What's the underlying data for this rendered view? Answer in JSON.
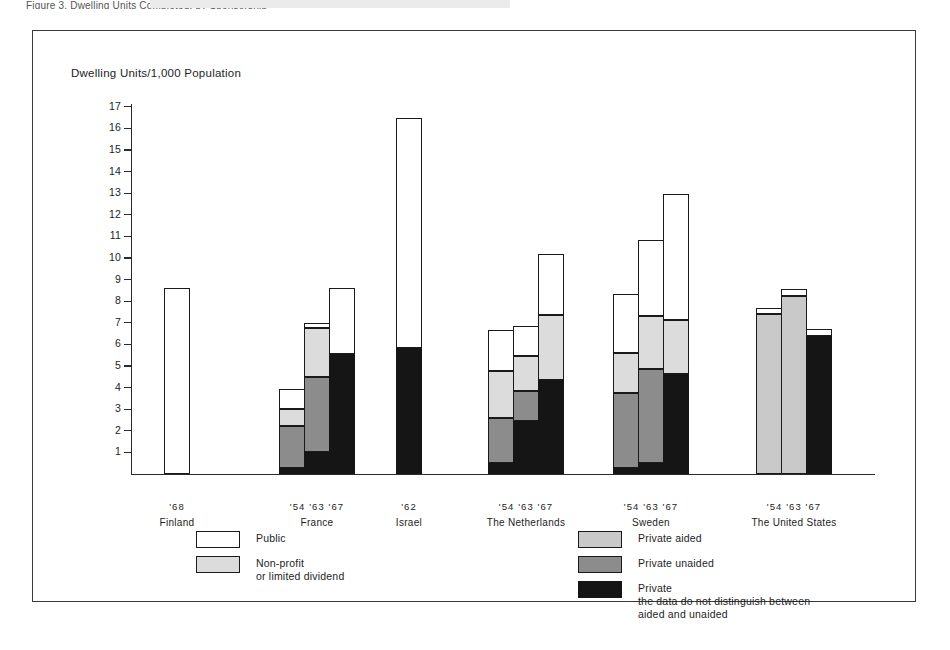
{
  "page": {
    "cropped_caption": "Figure 3. Dwelling Units Completed, by Sponsorship"
  },
  "chart_data": {
    "type": "bar",
    "subtype": "stacked",
    "title": "Dwelling Units/1,000 Population",
    "ylabel": "Dwelling Units/1,000 Population",
    "xlabel": "",
    "ylim": [
      0,
      17
    ],
    "yticks": [
      1,
      2,
      3,
      4,
      5,
      6,
      7,
      8,
      9,
      10,
      11,
      12,
      13,
      14,
      15,
      16,
      17
    ],
    "grid": false,
    "legend_position": "bottom",
    "series": [
      {
        "key": "public",
        "name": "Public",
        "color": "#ffffff"
      },
      {
        "key": "nonprofit",
        "name": "Non-profit or limited dividend",
        "color": "#dcdcdc"
      },
      {
        "key": "aided",
        "name": "Private aided",
        "color": "#c9c9c9"
      },
      {
        "key": "unaided",
        "name": "Private unaided",
        "color": "#8c8c8c"
      },
      {
        "key": "private",
        "name": "Private (aided and unaided combined)",
        "color": "#151515"
      }
    ],
    "groups": [
      {
        "country": "Finland",
        "years": "'68",
        "bars": [
          {
            "year": "'68",
            "total": 8.6,
            "segments": [
              {
                "key": "public",
                "value": 8.6
              }
            ]
          }
        ]
      },
      {
        "country": "France",
        "years": "'54 '63 '67",
        "bars": [
          {
            "year": "'54",
            "total": 3.95,
            "segments": [
              {
                "key": "public",
                "value": 0.95
              },
              {
                "key": "nonprofit",
                "value": 0.8
              },
              {
                "key": "unaided",
                "value": 1.9
              },
              {
                "key": "private",
                "value": 0.3
              }
            ]
          },
          {
            "year": "'63",
            "total": 7.0,
            "segments": [
              {
                "key": "public",
                "value": 0.25
              },
              {
                "key": "nonprofit",
                "value": 2.25
              },
              {
                "key": "unaided",
                "value": 3.5
              },
              {
                "key": "private",
                "value": 1.0
              }
            ]
          },
          {
            "year": "'67",
            "total": 8.6,
            "segments": [
              {
                "key": "public",
                "value": 3.05
              },
              {
                "key": "private",
                "value": 5.55
              }
            ]
          }
        ]
      },
      {
        "country": "Israel",
        "years": "'62",
        "bars": [
          {
            "year": "'62",
            "total": 16.5,
            "segments": [
              {
                "key": "public",
                "value": 10.65
              },
              {
                "key": "private",
                "value": 5.85
              }
            ]
          }
        ]
      },
      {
        "country": "The Netherlands",
        "years": "'54 '63 '67",
        "bars": [
          {
            "year": "'54",
            "total": 6.65,
            "segments": [
              {
                "key": "public",
                "value": 1.9
              },
              {
                "key": "nonprofit",
                "value": 2.15
              },
              {
                "key": "unaided",
                "value": 2.1
              },
              {
                "key": "private",
                "value": 0.5
              }
            ]
          },
          {
            "year": "'63",
            "total": 6.85,
            "segments": [
              {
                "key": "public",
                "value": 1.4
              },
              {
                "key": "nonprofit",
                "value": 1.6
              },
              {
                "key": "unaided",
                "value": 1.4
              },
              {
                "key": "private",
                "value": 2.45
              }
            ]
          },
          {
            "year": "'67",
            "total": 10.2,
            "segments": [
              {
                "key": "public",
                "value": 2.85
              },
              {
                "key": "nonprofit",
                "value": 3.0
              },
              {
                "key": "private",
                "value": 4.35
              }
            ]
          }
        ]
      },
      {
        "country": "Sweden",
        "years": "'54 '63 '67",
        "bars": [
          {
            "year": "'54",
            "total": 8.35,
            "segments": [
              {
                "key": "public",
                "value": 2.75
              },
              {
                "key": "nonprofit",
                "value": 1.85
              },
              {
                "key": "unaided",
                "value": 3.45
              },
              {
                "key": "private",
                "value": 0.3
              }
            ]
          },
          {
            "year": "'63",
            "total": 10.85,
            "segments": [
              {
                "key": "public",
                "value": 3.55
              },
              {
                "key": "nonprofit",
                "value": 2.45
              },
              {
                "key": "unaided",
                "value": 4.35
              },
              {
                "key": "private",
                "value": 0.5
              }
            ]
          },
          {
            "year": "'67",
            "total": 12.95,
            "segments": [
              {
                "key": "public",
                "value": 5.8
              },
              {
                "key": "nonprofit",
                "value": 2.5
              },
              {
                "key": "private",
                "value": 4.65
              }
            ]
          }
        ]
      },
      {
        "country": "The United States",
        "years": "'54 '63 '67",
        "bars": [
          {
            "year": "'54",
            "total": 7.7,
            "segments": [
              {
                "key": "public",
                "value": 0.3
              },
              {
                "key": "aided",
                "value": 7.4
              }
            ]
          },
          {
            "year": "'63",
            "total": 8.55,
            "segments": [
              {
                "key": "public",
                "value": 0.3
              },
              {
                "key": "aided",
                "value": 8.25
              }
            ]
          },
          {
            "year": "'67",
            "total": 6.7,
            "segments": [
              {
                "key": "public",
                "value": 0.3
              },
              {
                "key": "private",
                "value": 6.4
              }
            ]
          }
        ]
      }
    ],
    "legend": {
      "left_column": [
        {
          "key": "public",
          "label": "Public",
          "sub": ""
        },
        {
          "key": "nonprofit",
          "label": "Non-profit",
          "sub": "or limited dividend"
        }
      ],
      "right_column": [
        {
          "key": "aided",
          "label": "Private aided",
          "sub": ""
        },
        {
          "key": "unaided",
          "label": "Private unaided",
          "sub": ""
        },
        {
          "key": "private",
          "label": "Private",
          "sub": "the data do not distinguish between",
          "sub2": "aided and unaided"
        }
      ]
    }
  }
}
